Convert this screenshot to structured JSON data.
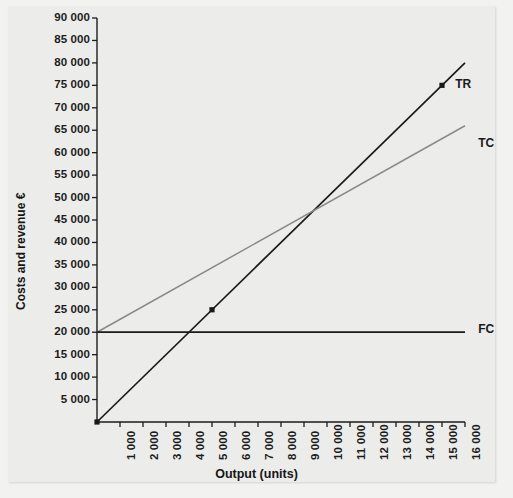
{
  "chart_data": {
    "type": "line",
    "title": "",
    "xlabel": "Output (units)",
    "ylabel": "Costs and revenue €",
    "xlim": [
      0,
      16000
    ],
    "ylim": [
      0,
      90000
    ],
    "grid": false,
    "legend_position": "right-inline",
    "x_ticks": [
      1000,
      2000,
      3000,
      4000,
      5000,
      6000,
      7000,
      8000,
      9000,
      10000,
      11000,
      12000,
      13000,
      14000,
      15000,
      16000
    ],
    "x_tick_labels": [
      "1 000",
      "2 000",
      "3 000",
      "4 000",
      "5 000",
      "6 000",
      "7 000",
      "8 000",
      "9 000",
      "10 000",
      "11 000",
      "12 000",
      "13 000",
      "14 000",
      "15 000",
      "16 000"
    ],
    "y_ticks": [
      5000,
      10000,
      15000,
      20000,
      25000,
      30000,
      35000,
      40000,
      45000,
      50000,
      55000,
      60000,
      65000,
      70000,
      75000,
      80000,
      85000,
      90000
    ],
    "y_tick_labels": [
      "5 000",
      "10 000",
      "15 000",
      "20 000",
      "25 000",
      "30 000",
      "35 000",
      "40 000",
      "45 000",
      "50 000",
      "55 000",
      "60 000",
      "65 000",
      "70 000",
      "75 000",
      "80 000",
      "85 000",
      "90 000"
    ],
    "series": [
      {
        "name": "TR",
        "label": "TR",
        "color": "#1a1a1a",
        "x": [
          0,
          16000
        ],
        "values": [
          0,
          80000
        ],
        "markers": [
          {
            "x": 0,
            "y": 0
          },
          {
            "x": 5000,
            "y": 25000
          },
          {
            "x": 15000,
            "y": 75000
          }
        ]
      },
      {
        "name": "TC",
        "label": "TC",
        "color": "#8a8a8a",
        "x": [
          0,
          16000
        ],
        "values": [
          20000,
          66000
        ],
        "markers": []
      },
      {
        "name": "FC",
        "label": "FC",
        "color": "#1a1a1a",
        "x": [
          0,
          16000
        ],
        "values": [
          20000,
          20000
        ],
        "markers": []
      }
    ],
    "annotations": [
      {
        "text": "TR",
        "x": 15400,
        "y": 75000
      },
      {
        "text": "TC",
        "x": 16400,
        "y": 62000
      },
      {
        "text": "FC",
        "x": 16400,
        "y": 20600
      }
    ],
    "break_even": {
      "x": 10000,
      "y": 50000
    }
  }
}
